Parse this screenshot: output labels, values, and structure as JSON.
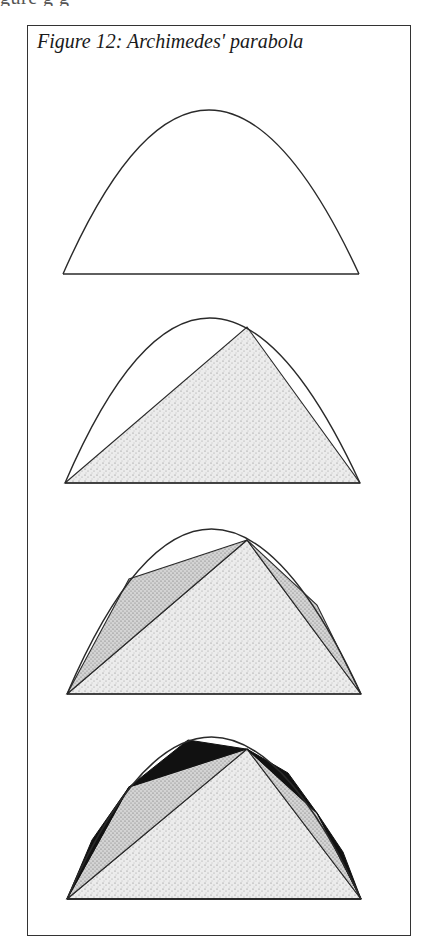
{
  "page": {
    "cutoff_text_above": "gure g g",
    "figure_caption": "Figure 12: Archimedes' parabola"
  },
  "diagram": {
    "title": "Figure 12: Archimedes' parabola",
    "panels": [
      {
        "step": 1,
        "description": "Parabolic segment (parabola arc with chord base)",
        "fills": []
      },
      {
        "step": 2,
        "description": "Largest inscribed triangle, stippled",
        "fills": [
          "light-stipple"
        ]
      },
      {
        "step": 3,
        "description": "Two further triangles inscribed in remaining segments, darker stipple",
        "fills": [
          "light-stipple",
          "medium-stipple"
        ]
      },
      {
        "step": 4,
        "description": "Four further triangles inscribed, filled black",
        "fills": [
          "light-stipple",
          "medium-stipple",
          "black"
        ]
      }
    ],
    "colors": {
      "line": "#2a2a2a",
      "stipple_light": "#d9d9d9",
      "stipple_medium": "#bdbdbd",
      "black": "#111111",
      "frame": "#333333"
    }
  }
}
